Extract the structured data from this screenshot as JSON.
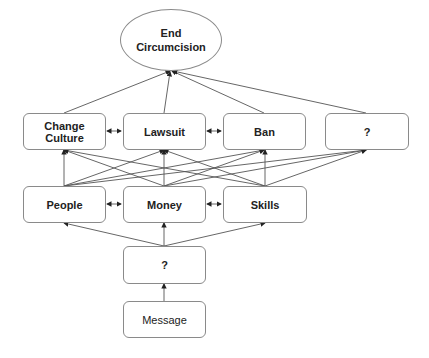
{
  "diagram": {
    "goal": {
      "line1": "End",
      "line2": "Circumcision"
    },
    "strategies": [
      {
        "id": "change-culture",
        "label": "Change Culture"
      },
      {
        "id": "lawsuit",
        "label": "Lawsuit"
      },
      {
        "id": "ban",
        "label": "Ban"
      },
      {
        "id": "unknown-strategy",
        "label": "?"
      }
    ],
    "resources": [
      {
        "id": "people",
        "label": "People"
      },
      {
        "id": "money",
        "label": "Money"
      },
      {
        "id": "skills",
        "label": "Skills"
      }
    ],
    "intermediate": {
      "label": "?"
    },
    "source": {
      "label": "Message"
    },
    "edges": [
      {
        "from": "message",
        "to": "intermediate"
      },
      {
        "from": "intermediate",
        "to": "people"
      },
      {
        "from": "intermediate",
        "to": "money"
      },
      {
        "from": "intermediate",
        "to": "skills"
      },
      {
        "from": "people",
        "to": "money",
        "bidirectional": true
      },
      {
        "from": "money",
        "to": "skills",
        "bidirectional": true
      },
      {
        "from": "resources",
        "to": "all strategies"
      },
      {
        "from": "change-culture",
        "to": "lawsuit",
        "bidirectional": true
      },
      {
        "from": "lawsuit",
        "to": "ban",
        "bidirectional": true
      },
      {
        "from": "all strategies",
        "to": "end-circumcision"
      }
    ]
  }
}
